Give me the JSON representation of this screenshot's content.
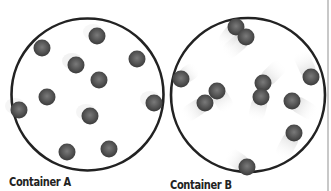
{
  "containers": [
    {
      "label": "Container A",
      "cx": 87.5,
      "cy": 94.5,
      "r": 76,
      "particles": [
        {
          "x": 42,
          "y": 48,
          "trail": 0
        },
        {
          "x": 97,
          "y": 36,
          "trail": 0.3
        },
        {
          "x": 76,
          "y": 65,
          "trail": 0.5
        },
        {
          "x": 137,
          "y": 59,
          "trail": 0
        },
        {
          "x": 99,
          "y": 80,
          "trail": 0
        },
        {
          "x": 47,
          "y": 97,
          "trail": 0
        },
        {
          "x": 19,
          "y": 110,
          "trail": 0.4
        },
        {
          "x": 154,
          "y": 103,
          "trail": 0.4
        },
        {
          "x": 90,
          "y": 116,
          "trail": 0.4
        },
        {
          "x": 67,
          "y": 152,
          "trail": 0
        },
        {
          "x": 109,
          "y": 149,
          "trail": 0
        }
      ]
    },
    {
      "label": "Container B",
      "cx": 248,
      "cy": 95,
      "r": 77,
      "particles": [
        {
          "x": 236,
          "y": 27,
          "tx": -14,
          "ty": 20
        },
        {
          "x": 246,
          "y": 37,
          "tx": -22,
          "ty": 18
        },
        {
          "x": 181,
          "y": 79,
          "tx": 16,
          "ty": -12
        },
        {
          "x": 311,
          "y": 77,
          "tx": -12,
          "ty": -26
        },
        {
          "x": 217,
          "y": 91,
          "tx": 12,
          "ty": 20
        },
        {
          "x": 205,
          "y": 103,
          "tx": -22,
          "ty": 14
        },
        {
          "x": 263,
          "y": 83,
          "tx": 20,
          "ty": -20
        },
        {
          "x": 261,
          "y": 97,
          "tx": -6,
          "ty": 24
        },
        {
          "x": 292,
          "y": 101,
          "tx": 24,
          "ty": 14
        },
        {
          "x": 294,
          "y": 133,
          "tx": -14,
          "ty": 26
        },
        {
          "x": 247,
          "y": 167,
          "tx": -20,
          "ty": -14
        }
      ]
    }
  ],
  "colors": {
    "outline": "#222222",
    "particle": "#4a4a4a",
    "trail": "#d9d9d9"
  }
}
